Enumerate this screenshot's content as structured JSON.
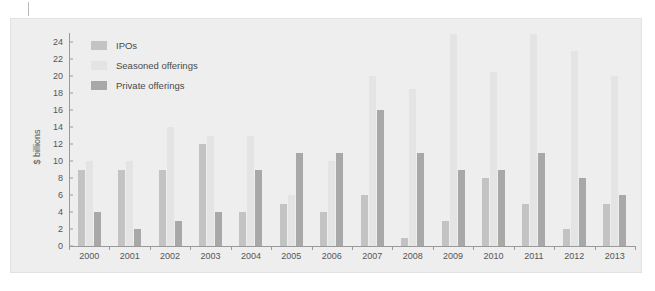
{
  "chart_data": {
    "type": "bar",
    "title": "",
    "subtitle": "",
    "xlabel": "",
    "ylabel": "$ billions",
    "ylim": [
      0,
      25
    ],
    "y_ticks": [
      0,
      2,
      4,
      6,
      8,
      10,
      12,
      14,
      16,
      18,
      20,
      22,
      24
    ],
    "grid": false,
    "legend_position": "top-left",
    "axis_max_label": 24,
    "note": "Seasoned offerings bars for 2009 and 2011 extend past the top of the plotted axis",
    "categories": [
      "2000",
      "2001",
      "2002",
      "2003",
      "2004",
      "2005",
      "2006",
      "2007",
      "2008",
      "2009",
      "2010",
      "2011",
      "2012",
      "2013"
    ],
    "series": [
      {
        "name": "IPOs",
        "color": "#c3c3c3",
        "values": [
          9,
          9,
          9,
          12,
          4,
          5,
          4,
          6,
          1,
          3,
          8,
          5,
          2,
          5
        ]
      },
      {
        "name": "Seasoned offerings",
        "color": "#e4e4e4",
        "values": [
          10,
          10,
          14,
          13,
          13,
          6,
          10,
          20,
          18.5,
          25,
          20.5,
          25,
          23,
          20
        ]
      },
      {
        "name": "Private offerings",
        "color": "#a8a8a8",
        "values": [
          4,
          2,
          3,
          4,
          9,
          11,
          11,
          16,
          11,
          9,
          9,
          11,
          8,
          6
        ]
      }
    ]
  },
  "colors": {
    "panel_background": "#eeeeee",
    "page_background": "#ffffff",
    "axis": "#9a9a9a",
    "text": "#555555"
  }
}
